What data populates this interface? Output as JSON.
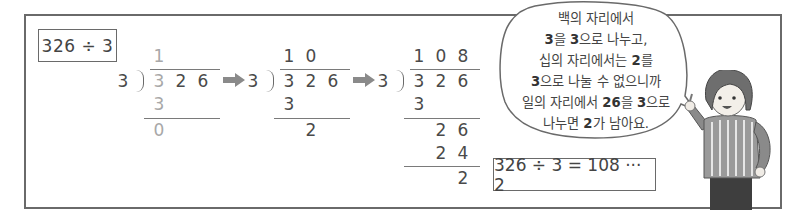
{
  "problem": {
    "expression": "326 ÷ 3"
  },
  "steps": [
    {
      "divisor": "3",
      "quotient": [
        "1",
        "",
        ""
      ],
      "dividend": [
        "3",
        "2",
        "6"
      ],
      "rows": [
        {
          "digits": [
            "3",
            "",
            ""
          ]
        },
        {
          "digits": [
            "0",
            "",
            ""
          ]
        }
      ]
    },
    {
      "divisor": "3",
      "quotient": [
        "1",
        "0",
        ""
      ],
      "dividend": [
        "3",
        "2",
        "6"
      ],
      "rows": [
        {
          "digits": [
            "3",
            "",
            ""
          ]
        },
        {
          "digits": [
            "",
            "2",
            ""
          ]
        }
      ]
    },
    {
      "divisor": "3",
      "quotient": [
        "1",
        "0",
        "8"
      ],
      "dividend": [
        "3",
        "2",
        "6"
      ],
      "rows": [
        {
          "digits": [
            "3",
            "",
            ""
          ]
        },
        {
          "digits": [
            "",
            "2",
            "6"
          ]
        },
        {
          "digits": [
            "",
            "2",
            "4"
          ]
        },
        {
          "digits": [
            "",
            "",
            "2"
          ]
        }
      ]
    }
  ],
  "arrows": [
    "right-arrow",
    "right-arrow"
  ],
  "speech_bubble": {
    "lines": [
      [
        {
          "t": "백의 자리에서",
          "b": false
        }
      ],
      [
        {
          "t": "3",
          "b": true
        },
        {
          "t": "을 ",
          "b": false
        },
        {
          "t": "3",
          "b": true
        },
        {
          "t": "으로 나누고,",
          "b": false
        }
      ],
      [
        {
          "t": "십의 자리에서는 ",
          "b": false
        },
        {
          "t": "2",
          "b": true
        },
        {
          "t": "를",
          "b": false
        }
      ],
      [
        {
          "t": "3",
          "b": true
        },
        {
          "t": "으로 나눌 수 없으니까",
          "b": false
        }
      ],
      [
        {
          "t": "일의 자리에서 ",
          "b": false
        },
        {
          "t": "26",
          "b": true
        },
        {
          "t": "을 ",
          "b": false
        },
        {
          "t": "3",
          "b": true
        },
        {
          "t": "으로",
          "b": false
        }
      ],
      [
        {
          "t": "나누면 ",
          "b": false
        },
        {
          "t": "2",
          "b": true
        },
        {
          "t": "가 남아요.",
          "b": false
        }
      ]
    ]
  },
  "result": {
    "expression": "326 ÷ 3 = 108 ··· 2"
  },
  "colors": {
    "frame": "#6a6a6a",
    "text": "#444444",
    "faded_digit": "#a8a8a8",
    "arrow": "#8a8a8a"
  }
}
